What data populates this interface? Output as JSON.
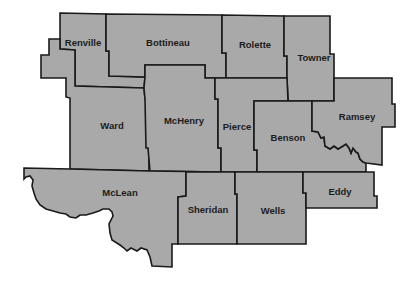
{
  "map": {
    "region": "North Dakota counties",
    "fill_color": "#a9a9a9",
    "border_color": "#1a1a1a",
    "background_color": "#ffffff",
    "counties": [
      {
        "name": "Renville"
      },
      {
        "name": "Bottineau"
      },
      {
        "name": "Rolette"
      },
      {
        "name": "Towner"
      },
      {
        "name": "Ward"
      },
      {
        "name": "McHenry"
      },
      {
        "name": "Pierce"
      },
      {
        "name": "Benson"
      },
      {
        "name": "Ramsey"
      },
      {
        "name": "McLean"
      },
      {
        "name": "Sheridan"
      },
      {
        "name": "Wells"
      },
      {
        "name": "Eddy"
      }
    ]
  }
}
